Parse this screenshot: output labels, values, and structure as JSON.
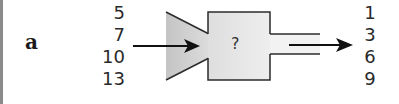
{
  "figure": {
    "label": "a",
    "machine_label": "?",
    "inputs": [
      "5",
      "7",
      "10",
      "13"
    ],
    "outputs": [
      "1",
      "3",
      "6",
      "9"
    ],
    "colors": {
      "funnel_fill": "#cfcfcf",
      "box_fill": "#e6e6e6",
      "stroke": "#2b2b2b",
      "arrow": "#111111"
    }
  }
}
